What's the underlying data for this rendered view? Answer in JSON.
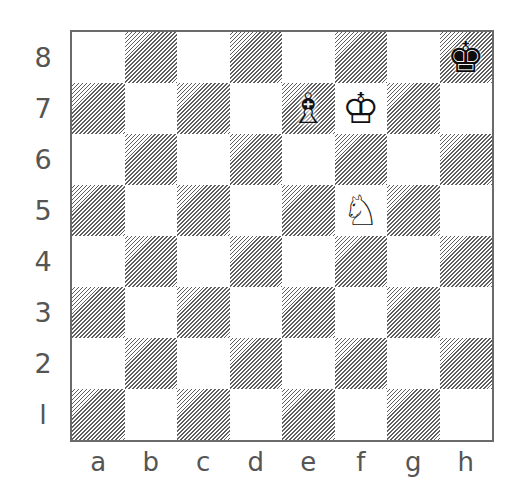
{
  "diagram": {
    "type": "chess-position",
    "ranks": [
      "8",
      "7",
      "6",
      "5",
      "4",
      "3",
      "2",
      "l"
    ],
    "files": [
      "a",
      "b",
      "c",
      "d",
      "e",
      "f",
      "g",
      "h"
    ],
    "colors": {
      "border": "#6a6a6a",
      "hatch": "#5e5e5e",
      "light_square": "#ffffff",
      "label": "#555555"
    },
    "pieces": [
      {
        "square": "h8",
        "color": "black",
        "type": "king",
        "glyph": "♚"
      },
      {
        "square": "e7",
        "color": "white",
        "type": "bishop",
        "glyph": "♗"
      },
      {
        "square": "f7",
        "color": "white",
        "type": "king",
        "glyph": "♔"
      },
      {
        "square": "f5",
        "color": "white",
        "type": "knight",
        "glyph": "♘"
      }
    ]
  }
}
